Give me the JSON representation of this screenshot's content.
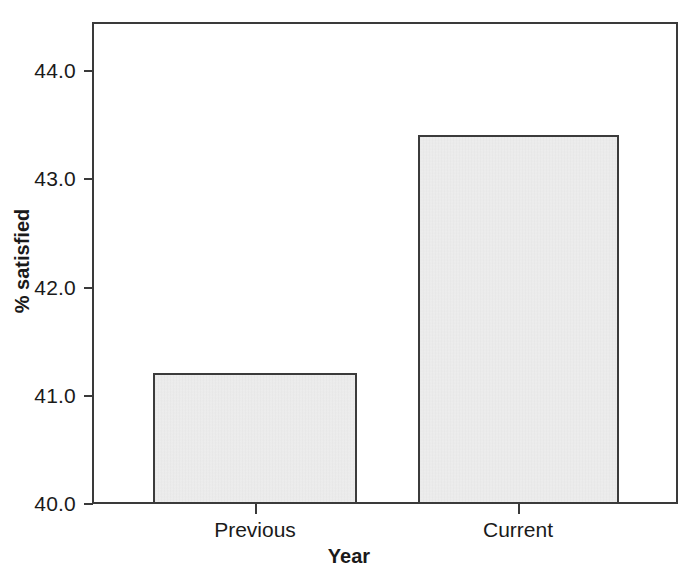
{
  "chart_data": {
    "type": "bar",
    "title": "",
    "subtitle": "",
    "xlabel": "Year",
    "ylabel": "% satisfied",
    "categories": [
      "Previous",
      "Current"
    ],
    "values": [
      41.2,
      43.4
    ],
    "series": [
      {
        "name": "% satisfied",
        "values": [
          41.2,
          43.4
        ]
      }
    ],
    "ylim": [
      40.0,
      44.5
    ],
    "yticks": [
      40.0,
      41.0,
      42.0,
      43.0,
      44.0
    ],
    "ytick_labels": [
      "40.0",
      "41.0",
      "42.0",
      "43.0",
      "44.0"
    ],
    "xtick_labels": [
      "Previous",
      "Current"
    ],
    "grid": false,
    "legend": false,
    "legend_position": "none",
    "bar_fill_color": "#e9e9e9",
    "bar_edge_color": "#3b3b3b",
    "axis_color": "#3a3a3a",
    "background_color": "#ffffff"
  },
  "axes": {
    "y_title": "% satisfied",
    "x_title": "Year",
    "y_labels": {
      "t40": "40.0",
      "t41": "41.0",
      "t42": "42.0",
      "t43": "43.0",
      "t44": "44.0"
    },
    "x_labels": {
      "previous": "Previous",
      "current": "Current"
    }
  }
}
